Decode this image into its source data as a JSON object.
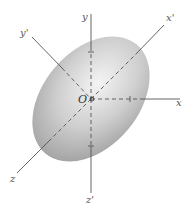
{
  "figure": {
    "origin_label": "O",
    "axes": [
      {
        "id": "x",
        "label": "x"
      },
      {
        "id": "y",
        "label": "y"
      },
      {
        "id": "z",
        "label": "z"
      },
      {
        "id": "x_prime",
        "label": "x'"
      },
      {
        "id": "y_prime",
        "label": "y'"
      },
      {
        "id": "z_prime",
        "label": "z'"
      }
    ],
    "colors": {
      "axis": "#444444",
      "ellipse_light": "#f2f2f2",
      "ellipse_dark": "#9a9a9a",
      "background": "#ffffff"
    }
  }
}
